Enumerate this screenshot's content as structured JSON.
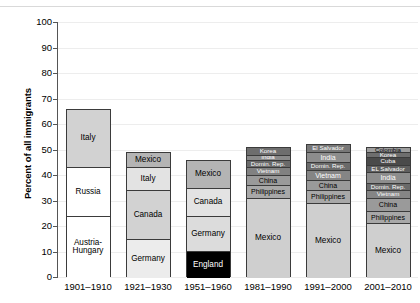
{
  "chart_data": {
    "type": "bar",
    "subtype": "stacked-bar",
    "title": "",
    "xlabel": "",
    "ylabel": "Percent of all immigrants",
    "ylim": [
      0,
      100
    ],
    "ytick_labels": [
      "0",
      "10",
      "20",
      "30",
      "40",
      "50",
      "60",
      "70",
      "80",
      "90",
      "100"
    ],
    "ytick_values": [
      0,
      10,
      20,
      30,
      40,
      50,
      60,
      70,
      80,
      90,
      100
    ],
    "grid": true,
    "legend": "none (in-segment labels)",
    "categories": [
      "1901–1910",
      "1921–1930",
      "1951–1960",
      "1981–1990",
      "1991–2000",
      "2001–2010"
    ],
    "bars": [
      {
        "category": "1901–1910",
        "total": 66,
        "segments": [
          {
            "label": "Italy",
            "value": 23,
            "fill": "#d2d2d2"
          },
          {
            "label": "Russia",
            "value": 19,
            "fill": "#ffffff"
          },
          {
            "label": "Austria-Hungary",
            "value": 24,
            "fill": "#ffffff"
          }
        ]
      },
      {
        "category": "1921–1930",
        "total": 49,
        "segments": [
          {
            "label": "Mexico",
            "value": 6,
            "fill": "#b4b4b4"
          },
          {
            "label": "Italy",
            "value": 9,
            "fill": "#e3e3e3"
          },
          {
            "label": "Canada",
            "value": 19,
            "fill": "#d2d2d2"
          },
          {
            "label": "Germany",
            "value": 15,
            "fill": "#ececec"
          }
        ]
      },
      {
        "category": "1951–1960",
        "total": 46,
        "segments": [
          {
            "label": "Mexico",
            "value": 11,
            "fill": "#b4b4b4"
          },
          {
            "label": "Canada",
            "value": 11,
            "fill": "#e3e3e3"
          },
          {
            "label": "Germany",
            "value": 14,
            "fill": "#dcdcdc"
          },
          {
            "label": "England",
            "value": 10,
            "fill": "#000000"
          }
        ]
      },
      {
        "category": "1981–1990",
        "total": 51,
        "segments": [
          {
            "label": "Korea",
            "value": 3,
            "fill": "#6e6e6e"
          },
          {
            "label": "India",
            "value": 2,
            "fill": "#8a8a8a"
          },
          {
            "label": "Domin. Rep.",
            "value": 3,
            "fill": "#6a6a6a"
          },
          {
            "label": "Vietnam",
            "value": 3,
            "fill": "#818181"
          },
          {
            "label": "China",
            "value": 4,
            "fill": "#9a9a9a"
          },
          {
            "label": "Philippines",
            "value": 5,
            "fill": "#a8a8a8"
          },
          {
            "label": "Mexico",
            "value": 31,
            "fill": "#cfcfcf"
          }
        ]
      },
      {
        "category": "1991–2000",
        "total": 52,
        "segments": [
          {
            "label": "El Salvador",
            "value": 3,
            "fill": "#787878"
          },
          {
            "label": "India",
            "value": 4,
            "fill": "#8d8d8d"
          },
          {
            "label": "Domin. Rep.",
            "value": 3,
            "fill": "#6a6a6a"
          },
          {
            "label": "Vietnam",
            "value": 4,
            "fill": "#858585"
          },
          {
            "label": "China",
            "value": 4,
            "fill": "#9a9a9a"
          },
          {
            "label": "Philippines",
            "value": 5,
            "fill": "#a8a8a8"
          },
          {
            "label": "Mexico",
            "value": 29,
            "fill": "#cfcfcf"
          }
        ]
      },
      {
        "category": "2001–2010",
        "total": 51,
        "segments": [
          {
            "label": "Colombia",
            "value": 2,
            "fill": "#9e9e9e"
          },
          {
            "label": "Korea",
            "value": 2,
            "fill": "#6e6e6e"
          },
          {
            "label": "Cuba",
            "value": 3,
            "fill": "#4a4a4a"
          },
          {
            "label": "EL Salvador",
            "value": 3,
            "fill": "#5f5f5f"
          },
          {
            "label": "India",
            "value": 4,
            "fill": "#8d8d8d"
          },
          {
            "label": "Domin. Rep.",
            "value": 3,
            "fill": "#6a6a6a"
          },
          {
            "label": "Vietnam",
            "value": 3,
            "fill": "#858585"
          },
          {
            "label": "China",
            "value": 5,
            "fill": "#9a9a9a"
          },
          {
            "label": "Philippines",
            "value": 5,
            "fill": "#a8a8a8"
          },
          {
            "label": "Mexico",
            "value": 21,
            "fill": "#cfcfcf"
          }
        ]
      }
    ]
  }
}
